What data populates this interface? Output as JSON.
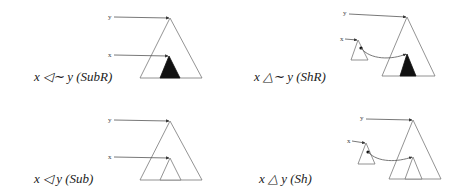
{
  "colors": {
    "outline": "#777777",
    "filled_subtree": "#111111",
    "pointer": "#555555",
    "text": "#222222"
  },
  "panels": [
    {
      "id": "subr",
      "relation": "x ◁∼ y (SubR)",
      "pointer_labels": {
        "y": "y",
        "x": "x"
      },
      "inner_subtree": "filled",
      "external_subtree": false
    },
    {
      "id": "shr",
      "relation": "x △∼ y (ShR)",
      "pointer_labels": {
        "y": "y",
        "x": "x"
      },
      "inner_subtree": "filled",
      "external_subtree": true
    },
    {
      "id": "sub",
      "relation": "x ◁ y (Sub)",
      "pointer_labels": {
        "y": "y",
        "x": "x"
      },
      "inner_subtree": "outline",
      "external_subtree": false
    },
    {
      "id": "sh",
      "relation": "x △ y (Sh)",
      "pointer_labels": {
        "y": "y",
        "x": "x"
      },
      "inner_subtree": "outline",
      "external_subtree": true
    }
  ]
}
